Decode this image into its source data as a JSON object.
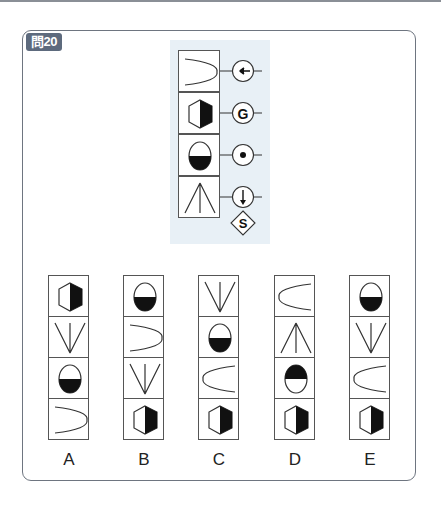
{
  "header": {
    "problem_badge": "問20"
  },
  "question": {
    "column": [
      "parabola-right",
      "hexagon-right-black",
      "oval-bottom-black",
      "arrow-up-fan"
    ],
    "operators": [
      {
        "symbol": "arrow-left",
        "label": ""
      },
      {
        "symbol": "letter",
        "label": "G"
      },
      {
        "symbol": "dot",
        "label": ""
      },
      {
        "symbol": "arrow-down",
        "label": ""
      }
    ],
    "result_symbol": {
      "shape": "diamond",
      "label": "S"
    }
  },
  "options": [
    {
      "label": "A",
      "cells": [
        "hexagon-right-black",
        "arrow-down-fan",
        "oval-bottom-black",
        "parabola-right"
      ]
    },
    {
      "label": "B",
      "cells": [
        "oval-bottom-black",
        "parabola-right",
        "arrow-down-fan",
        "hexagon-right-black"
      ]
    },
    {
      "label": "C",
      "cells": [
        "arrow-down-fan",
        "oval-bottom-black",
        "parabola-left",
        "hexagon-right-black"
      ]
    },
    {
      "label": "D",
      "cells": [
        "parabola-left",
        "arrow-up-fan",
        "oval-top-black",
        "hexagon-right-black"
      ]
    },
    {
      "label": "E",
      "cells": [
        "oval-bottom-black",
        "arrow-down-fan",
        "parabola-left",
        "hexagon-right-black"
      ]
    }
  ],
  "colors": {
    "badge": "#5d6a7d",
    "panel": "#e8f0f6",
    "frame": "#6e7580"
  }
}
